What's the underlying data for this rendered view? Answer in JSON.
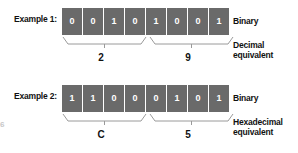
{
  "figure": {
    "background": "#ffffff",
    "cell_color": "#6a6a6a",
    "cell_text_color": "#ffffff",
    "text_color": "#111111",
    "artifact_mark": "6"
  },
  "examples": [
    {
      "label": "Example 1:",
      "bits": [
        "0",
        "0",
        "1",
        "0",
        "1",
        "0",
        "0",
        "1"
      ],
      "binary_label": "Binary",
      "equivalent_label": "Decimal equivalent",
      "nibbles": [
        {
          "value": "2"
        },
        {
          "value": "9"
        }
      ]
    },
    {
      "label": "Example 2:",
      "bits": [
        "1",
        "1",
        "0",
        "0",
        "0",
        "1",
        "0",
        "1"
      ],
      "binary_label": "Binary",
      "equivalent_label": "Hexadecimal equivalent",
      "nibbles": [
        {
          "value": "C"
        },
        {
          "value": "5"
        }
      ]
    }
  ]
}
